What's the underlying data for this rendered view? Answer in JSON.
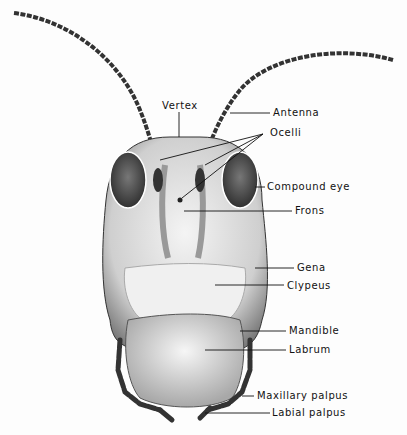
{
  "diagram": {
    "labels": [
      {
        "id": "vertex",
        "text": "Vertex",
        "x": 162,
        "y": 100
      },
      {
        "id": "antenna",
        "text": "Antenna",
        "x": 273,
        "y": 107
      },
      {
        "id": "ocelli",
        "text": "Ocelli",
        "x": 270,
        "y": 127
      },
      {
        "id": "compound-eye",
        "text": "Compound eye",
        "x": 267,
        "y": 181
      },
      {
        "id": "frons",
        "text": "Frons",
        "x": 295,
        "y": 205
      },
      {
        "id": "gena",
        "text": "Gena",
        "x": 297,
        "y": 263
      },
      {
        "id": "clypeus",
        "text": "Clypeus",
        "x": 287,
        "y": 281
      },
      {
        "id": "mandible",
        "text": "Mandible",
        "x": 289,
        "y": 326
      },
      {
        "id": "labrum",
        "text": "Labrum",
        "x": 289,
        "y": 345
      },
      {
        "id": "maxillary-palpus",
        "text": "Maxillary palpus",
        "x": 257,
        "y": 390
      },
      {
        "id": "labial-palpus",
        "text": "Labial palpus",
        "x": 272,
        "y": 407
      }
    ],
    "colors": {
      "ink": "#111111",
      "shade": "#555555",
      "paper": "#fdfdfd"
    }
  }
}
